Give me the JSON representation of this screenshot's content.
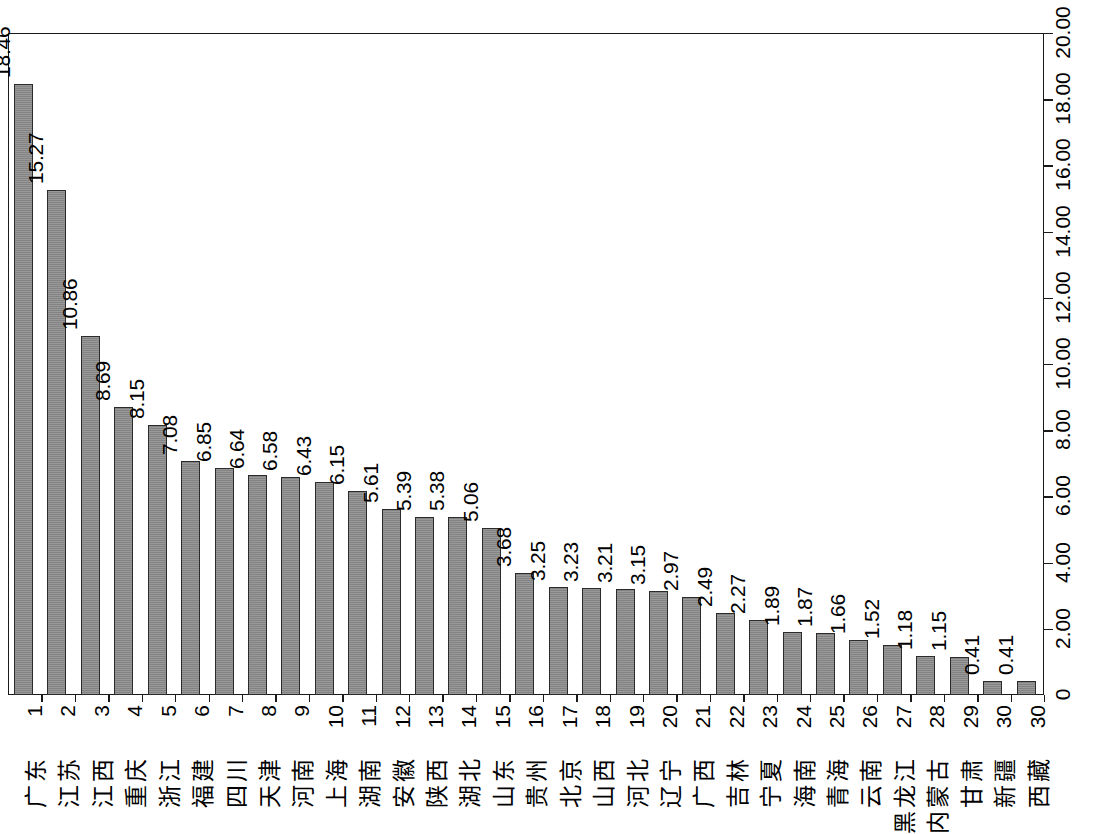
{
  "chart_data": {
    "type": "bar",
    "title": "",
    "subtitle": "",
    "xlabel": "",
    "ylabel": "",
    "orientation": "vertical-rotated-90",
    "grid": false,
    "legend": null,
    "ylim": [
      0,
      20
    ],
    "ytick_labels": [
      "0",
      "2.00",
      "4.00",
      "6.00",
      "8.00",
      "10.00",
      "12.00",
      "14.00",
      "16.00",
      "18.00",
      "20.00"
    ],
    "ytick_values": [
      0,
      2,
      4,
      6,
      8,
      10,
      12,
      14,
      16,
      18,
      20
    ],
    "ranks": [
      "1",
      "2",
      "3",
      "4",
      "5",
      "6",
      "7",
      "8",
      "9",
      "10",
      "11",
      "12",
      "13",
      "14",
      "15",
      "16",
      "17",
      "18",
      "19",
      "20",
      "21",
      "22",
      "23",
      "24",
      "25",
      "26",
      "27",
      "28",
      "29",
      "30",
      "30"
    ],
    "categories": [
      "广东",
      "江苏",
      "江西",
      "重庆",
      "浙江",
      "福建",
      "四川",
      "天津",
      "河南",
      "上海",
      "湖南",
      "安徽",
      "陕西",
      "湖北",
      "山东",
      "贵州",
      "北京",
      "山西",
      "河北",
      "辽宁",
      "广西",
      "吉林",
      "宁夏",
      "海南",
      "青海",
      "云南",
      "黑龙江",
      "内蒙古",
      "甘肃",
      "新疆",
      "西藏"
    ],
    "values": [
      18.46,
      15.27,
      10.86,
      8.69,
      8.15,
      7.08,
      6.85,
      6.64,
      6.58,
      6.43,
      6.15,
      5.61,
      5.39,
      5.38,
      5.06,
      3.68,
      3.25,
      3.23,
      3.21,
      3.15,
      2.97,
      2.49,
      2.27,
      1.89,
      1.87,
      1.66,
      1.52,
      1.18,
      1.15,
      0.41,
      0.41
    ],
    "value_labels": [
      "18.46",
      "15.27",
      "10.86",
      "8.69",
      "8.15",
      "7.08",
      "6.85",
      "6.64",
      "6.58",
      "6.43",
      "6.15",
      "5.61",
      "5.39",
      "5.38",
      "5.06",
      "3.68",
      "3.25",
      "3.23",
      "3.21",
      "3.15",
      "2.97",
      "2.49",
      "2.27",
      "1.89",
      "1.87",
      "1.66",
      "1.52",
      "1.18",
      "1.15",
      "0.41",
      "0.41"
    ],
    "colors": {
      "bar_fill": "#8a8a8a",
      "bar_border": "#2b2b2b",
      "axis": "#1a1a1a",
      "text": "#000000",
      "background": "#ffffff"
    }
  }
}
